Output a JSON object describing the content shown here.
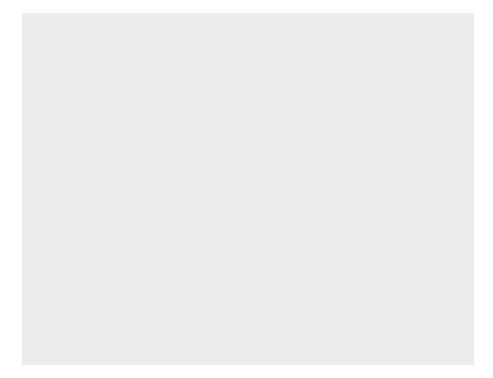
{
  "figure": {
    "background_color": "#ececeb",
    "plot_background_color": "#ffffff",
    "fill_color": "#b3b3b3",
    "line_color": "#000000"
  },
  "chart_data": {
    "type": "line",
    "title": "",
    "xlabel": "Year",
    "ylabel": "Federal government spending and tax collections (percent of total output)",
    "xlim": [
      1869,
      2006
    ],
    "ylim": [
      0,
      52
    ],
    "grid": false,
    "legend_position": "inline-annotations",
    "xticks": [
      1870,
      1880,
      1890,
      1900,
      1910,
      1920,
      1930,
      1940,
      1950,
      1960,
      1970,
      1980,
      1990,
      2000,
      2005
    ],
    "yticks": [
      0,
      5,
      10,
      15,
      20,
      25,
      30,
      35,
      40,
      45,
      50
    ],
    "series": [
      {
        "name": "GOVERNMENT SPENDING",
        "x": [
          1870,
          1872,
          1874,
          1876,
          1878,
          1880,
          1882,
          1884,
          1886,
          1888,
          1890,
          1892,
          1894,
          1896,
          1898,
          1900,
          1902,
          1904,
          1906,
          1908,
          1910,
          1912,
          1914,
          1916,
          1917,
          1918,
          1919,
          1920,
          1921,
          1922,
          1923,
          1924,
          1925,
          1926,
          1927,
          1928,
          1929,
          1930,
          1931,
          1932,
          1933,
          1934,
          1935,
          1936,
          1937,
          1938,
          1939,
          1940,
          1941,
          1942,
          1943,
          1944,
          1945,
          1946,
          1947,
          1948,
          1949,
          1950,
          1951,
          1952,
          1953,
          1954,
          1955,
          1956,
          1957,
          1958,
          1959,
          1960,
          1961,
          1962,
          1963,
          1964,
          1965,
          1966,
          1967,
          1968,
          1969,
          1970,
          1971,
          1972,
          1973,
          1974,
          1975,
          1976,
          1977,
          1978,
          1979,
          1980,
          1981,
          1982,
          1983,
          1984,
          1985,
          1986,
          1987,
          1988,
          1989,
          1990,
          1991,
          1992,
          1993,
          1994,
          1995,
          1996,
          1997,
          1998,
          1999,
          2000,
          2001,
          2002,
          2003,
          2004,
          2005
        ],
        "values": [
          5.2,
          4.4,
          4.0,
          3.6,
          3.4,
          3.3,
          3.2,
          3.1,
          3.3,
          3.4,
          3.5,
          3.4,
          3.6,
          3.5,
          4.2,
          3.6,
          3.2,
          3.1,
          2.9,
          3.0,
          2.9,
          2.8,
          2.6,
          2.6,
          7.5,
          18.0,
          24.8,
          12.0,
          7.2,
          5.2,
          4.5,
          4.2,
          3.9,
          3.6,
          3.5,
          3.4,
          3.6,
          4.0,
          5.1,
          7.4,
          8.6,
          10.8,
          9.5,
          10.8,
          9.0,
          8.2,
          10.5,
          10.2,
          12.5,
          24.8,
          44.0,
          43.6,
          41.0,
          24.0,
          14.5,
          11.8,
          14.5,
          15.6,
          14.5,
          19.4,
          20.4,
          18.8,
          17.3,
          16.5,
          17.0,
          17.9,
          18.8,
          18.0,
          18.4,
          18.8,
          18.6,
          18.5,
          17.2,
          17.8,
          19.4,
          20.5,
          19.4,
          19.3,
          19.5,
          19.6,
          18.7,
          18.7,
          21.3,
          21.4,
          20.7,
          20.7,
          20.1,
          21.6,
          22.2,
          23.1,
          23.5,
          22.1,
          22.8,
          22.5,
          21.6,
          21.2,
          21.2,
          21.8,
          22.3,
          22.1,
          21.4,
          21.0,
          20.7,
          20.2,
          19.6,
          19.1,
          18.6,
          18.4,
          18.5,
          19.4,
          19.9,
          19.6,
          20.1
        ]
      },
      {
        "name": "TAXES",
        "x": [
          1870,
          1872,
          1874,
          1876,
          1878,
          1880,
          1882,
          1884,
          1886,
          1888,
          1890,
          1892,
          1894,
          1896,
          1898,
          1900,
          1902,
          1904,
          1906,
          1908,
          1910,
          1912,
          1914,
          1916,
          1917,
          1918,
          1919,
          1920,
          1921,
          1922,
          1923,
          1924,
          1925,
          1926,
          1927,
          1928,
          1929,
          1930,
          1931,
          1932,
          1933,
          1934,
          1935,
          1936,
          1937,
          1938,
          1939,
          1940,
          1941,
          1942,
          1943,
          1944,
          1945,
          1946,
          1947,
          1948,
          1949,
          1950,
          1951,
          1952,
          1953,
          1954,
          1955,
          1956,
          1957,
          1958,
          1959,
          1960,
          1961,
          1962,
          1963,
          1964,
          1965,
          1966,
          1967,
          1968,
          1969,
          1970,
          1971,
          1972,
          1973,
          1974,
          1975,
          1976,
          1977,
          1978,
          1979,
          1980,
          1981,
          1982,
          1983,
          1984,
          1985,
          1986,
          1987,
          1988,
          1989,
          1990,
          1991,
          1992,
          1993,
          1994,
          1995,
          1996,
          1997,
          1998,
          1999,
          2000,
          2001,
          2002,
          2003,
          2004,
          2005
        ],
        "values": [
          4.6,
          4.0,
          3.6,
          3.2,
          3.1,
          3.3,
          3.6,
          3.4,
          3.5,
          3.8,
          3.9,
          3.5,
          3.1,
          3.0,
          3.2,
          3.4,
          3.1,
          2.9,
          2.9,
          2.8,
          2.8,
          2.7,
          2.6,
          2.6,
          5.2,
          10.5,
          16.8,
          11.0,
          8.0,
          5.6,
          4.8,
          4.5,
          4.2,
          4.1,
          4.3,
          4.2,
          4.1,
          4.0,
          3.6,
          3.1,
          3.6,
          5.0,
          5.3,
          5.2,
          6.4,
          7.8,
          7.2,
          6.8,
          7.7,
          10.3,
          13.7,
          21.0,
          20.5,
          17.9,
          16.8,
          16.5,
          14.8,
          14.6,
          16.4,
          19.2,
          19.0,
          18.6,
          17.0,
          17.7,
          18.0,
          17.4,
          16.5,
          18.1,
          17.9,
          17.9,
          17.9,
          17.7,
          17.1,
          17.5,
          18.5,
          17.7,
          20.0,
          19.1,
          17.4,
          17.7,
          17.7,
          18.4,
          17.9,
          17.3,
          18.1,
          18.1,
          19.1,
          19.1,
          19.8,
          19.3,
          17.6,
          17.5,
          17.8,
          17.6,
          18.5,
          18.3,
          18.4,
          18.1,
          17.9,
          17.6,
          17.6,
          18.1,
          18.5,
          18.9,
          19.3,
          20.0,
          20.0,
          20.9,
          19.8,
          17.9,
          16.5,
          16.4,
          17.6
        ]
      }
    ],
    "annotations": [
      {
        "name": "world-war-i",
        "text": "World War I",
        "x_px": 155,
        "y_px": 180,
        "leader": {
          "x1": 205,
          "y1": 184,
          "x2": 223,
          "y2": 198
        }
      },
      {
        "name": "world-war-ii",
        "text": "World War II",
        "x_px": 218,
        "y_px": 67,
        "leader": {
          "x1": 268,
          "y1": 71,
          "x2": 290,
          "y2": 86
        }
      },
      {
        "name": "government-spending",
        "text_lines": [
          "GOVERNMENT",
          "SPENDING"
        ],
        "x_px": 119,
        "y_px": 214
      },
      {
        "name": "great-depression",
        "text_lines": [
          "Great",
          "Depression"
        ],
        "x_px": 211,
        "y_px": 218,
        "leader": {
          "x1": 240,
          "y1": 238,
          "x2": 253,
          "y2": 258
        }
      },
      {
        "name": "taxes",
        "text": "TAXES",
        "x_px": 268,
        "y_px": 265
      },
      {
        "name": "federal-deficits",
        "text_lines": [
          "Federal government",
          "deficits of the",
          "1980s and early",
          "and mid 1990s"
        ],
        "x_px": 324,
        "y_px": 115,
        "leader": {
          "x1": 352,
          "y1": 162,
          "x2": 369,
          "y2": 186
        }
      },
      {
        "name": "federal-surpluses",
        "text_lines": [
          "Federal government",
          "surpluses of 1998",
          "to 2001"
        ],
        "x_px": 341,
        "y_px": 272,
        "leader": {
          "x1": 415,
          "y1": 219,
          "x2": 386,
          "y2": 262
        }
      }
    ]
  }
}
